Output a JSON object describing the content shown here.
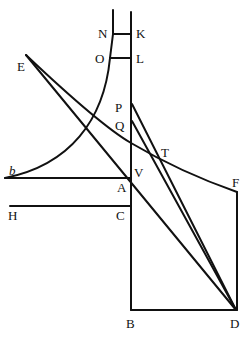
{
  "diagram": {
    "points": {
      "N": {
        "label": "N",
        "x": 113,
        "y": 34
      },
      "K": {
        "label": "K",
        "x": 131,
        "y": 34
      },
      "O": {
        "label": "O",
        "x": 110,
        "y": 58
      },
      "L": {
        "label": "L",
        "x": 131,
        "y": 58
      },
      "E": {
        "label": "E",
        "x": 26,
        "y": 55
      },
      "P": {
        "label": "P",
        "x": 132,
        "y": 104
      },
      "Q": {
        "label": "Q",
        "x": 132,
        "y": 121
      },
      "T": {
        "label": "T",
        "x": 157,
        "y": 158
      },
      "V": {
        "label": "V",
        "x": 131,
        "y": 176
      },
      "A": {
        "label": "A",
        "x": 131,
        "y": 178
      },
      "b": {
        "label": "b",
        "x": 12,
        "y": 178
      },
      "F": {
        "label": "F",
        "x": 237,
        "y": 192
      },
      "H": {
        "label": "H",
        "x": 10,
        "y": 206
      },
      "C": {
        "label": "C",
        "x": 131,
        "y": 206
      },
      "B": {
        "label": "B",
        "x": 131,
        "y": 310
      },
      "D": {
        "label": "D",
        "x": 236,
        "y": 310
      }
    },
    "labels": [
      "N",
      "K",
      "O",
      "L",
      "E",
      "P",
      "Q",
      "T",
      "b",
      "V",
      "A",
      "F",
      "H",
      "C",
      "B",
      "D"
    ]
  }
}
